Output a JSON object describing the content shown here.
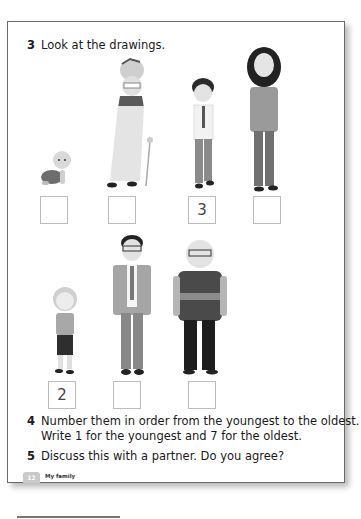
{
  "task3": {
    "number": "3",
    "text": "Look at the drawings."
  },
  "figures_row1": [
    {
      "id": "baby",
      "label": "baby crawling",
      "box_value": ""
    },
    {
      "id": "great-grandmother",
      "label": "old woman with walking stick",
      "box_value": ""
    },
    {
      "id": "boy",
      "label": "boy in shirt and tie",
      "box_value": "3"
    },
    {
      "id": "teenage-girl",
      "label": "girl with long dark hair",
      "box_value": ""
    }
  ],
  "figures_row2": [
    {
      "id": "little-girl",
      "label": "little girl",
      "box_value": "2"
    },
    {
      "id": "father",
      "label": "man in suit with glasses",
      "box_value": ""
    },
    {
      "id": "grandfather",
      "label": "old man with glasses and sweater",
      "box_value": ""
    }
  ],
  "task4": {
    "number": "4",
    "line1": "Number them in order from the youngest to the oldest.",
    "line2": "Write 1 for the youngest and 7 for the oldest."
  },
  "task5": {
    "number": "5",
    "text": "Discuss this with a partner. Do you agree?"
  },
  "footer": {
    "page_number": "12",
    "section": "My family"
  }
}
